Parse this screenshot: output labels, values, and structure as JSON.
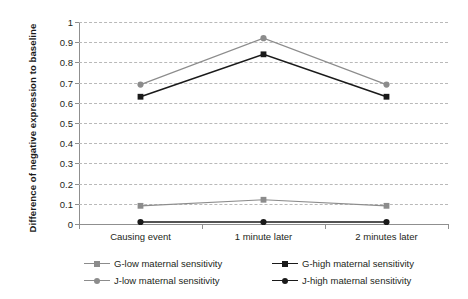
{
  "chart_data": {
    "type": "line",
    "title": "",
    "xlabel": "",
    "ylabel": "Difference of negative expression to baseline",
    "categories": [
      "Causing event",
      "1 minute later",
      "2 minutes later"
    ],
    "ylim": [
      0,
      1
    ],
    "ytick_labels": [
      "0",
      "0.1",
      "0.2",
      "0.3",
      "0.4",
      "0.5",
      "0.6",
      "0.7",
      "0.8",
      "0.9",
      "1"
    ],
    "ytick_values": [
      0,
      0.1,
      0.2,
      0.3,
      0.4,
      0.5,
      0.6,
      0.7,
      0.8,
      0.9,
      1
    ],
    "grid": true,
    "legend_position": "bottom",
    "series": [
      {
        "name": "G-low maternal sensitivity",
        "values": [
          0.09,
          0.12,
          0.09
        ],
        "color": "#8c8c8c",
        "marker": "square"
      },
      {
        "name": "G-high maternal sensitivity",
        "values": [
          0.63,
          0.84,
          0.63
        ],
        "color": "#1a1a1a",
        "marker": "square"
      },
      {
        "name": "J-low maternal sensitivity",
        "values": [
          0.69,
          0.92,
          0.69
        ],
        "color": "#8c8c8c",
        "marker": "circle"
      },
      {
        "name": "J-high maternal sensitivity",
        "values": [
          0.01,
          0.01,
          0.01
        ],
        "color": "#1a1a1a",
        "marker": "circle"
      }
    ]
  },
  "legend": {
    "items": [
      "G-low maternal sensitivity",
      "G-high maternal sensitivity",
      "J-low maternal sensitivity",
      "J-high maternal sensitivity"
    ]
  },
  "colors": {
    "gray_series": "#8c8c8c",
    "black_series": "#1a1a1a",
    "gridline": "#b9b9b9",
    "axis": "#8f8f8f",
    "text": "#231f20",
    "background": "#ffffff"
  }
}
